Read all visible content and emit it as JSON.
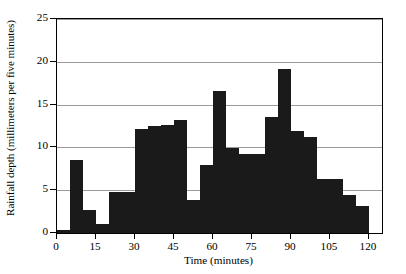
{
  "chart_data": {
    "type": "bar",
    "title": "",
    "subtitle": "",
    "xlabel": "Time (minutes)",
    "ylabel": "Rainfall depth (millimeters per five minutes)",
    "xlim": [
      0,
      125
    ],
    "ylim": [
      0,
      25
    ],
    "xticks": [
      0,
      15,
      30,
      45,
      60,
      75,
      90,
      105,
      120
    ],
    "yticks": [
      0,
      5,
      10,
      15,
      20,
      25
    ],
    "xtick_labels": [
      "0",
      "15",
      "30",
      "45",
      "60",
      "75",
      "90",
      "105",
      "120"
    ],
    "ytick_labels": [
      "0",
      "5",
      "10",
      "15",
      "20",
      "25"
    ],
    "grid": "horizontal",
    "legend": "none",
    "bin_width": 5,
    "bar_color": "#1a1a1a",
    "background_color": "#ffffff",
    "gridline_color": "#9a9a9a",
    "axis_color": "#000000",
    "categories": [
      "0-5",
      "5-10",
      "10-15",
      "15-20",
      "20-25",
      "25-30",
      "30-35",
      "35-40",
      "40-45",
      "45-50",
      "50-55",
      "55-60",
      "60-65",
      "65-70",
      "70-75",
      "75-80",
      "80-85",
      "85-90",
      "90-95",
      "95-100",
      "100-105",
      "105-110",
      "110-115",
      "115-120"
    ],
    "bin_starts": [
      0,
      5,
      10,
      15,
      20,
      25,
      30,
      35,
      40,
      45,
      50,
      55,
      60,
      65,
      70,
      75,
      80,
      85,
      90,
      95,
      100,
      105,
      110,
      115
    ],
    "values": [
      0.4,
      8.5,
      2.7,
      1.1,
      4.8,
      4.8,
      12.1,
      12.5,
      12.6,
      13.2,
      3.9,
      7.9,
      16.6,
      9.9,
      9.2,
      9.2,
      13.5,
      19.2,
      11.9,
      11.2,
      6.3,
      6.3,
      4.4,
      3.1
    ]
  }
}
